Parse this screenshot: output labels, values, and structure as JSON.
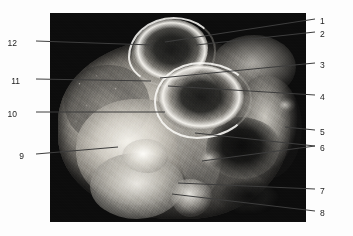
{
  "figure": {
    "kind": "anatomical-photograph",
    "rendering": "grayscale photographic plate on black background",
    "plate": {
      "x": 50,
      "y": 13,
      "width": 256,
      "height": 209,
      "background_color": "#0a0a0a"
    },
    "canvas": {
      "width": 353,
      "height": 236,
      "background_color": "#ffffff"
    }
  },
  "labels": {
    "line_color": "#3d3d3d",
    "text_color": "#1d1d1d",
    "right_side": [
      {
        "id": "1",
        "text": "1",
        "label_x": 320,
        "label_y": 17,
        "line_start_x": 315,
        "line_start_y": 19,
        "line_end_x": 165,
        "line_end_y": 42
      },
      {
        "id": "2",
        "text": "2",
        "label_x": 320,
        "label_y": 30,
        "line_start_x": 315,
        "line_start_y": 32,
        "line_end_x": 196,
        "line_end_y": 45
      },
      {
        "id": "3",
        "text": "3",
        "label_x": 320,
        "label_y": 61,
        "line_start_x": 315,
        "line_start_y": 63,
        "line_end_x": 160,
        "line_end_y": 78
      },
      {
        "id": "4",
        "text": "4",
        "label_x": 320,
        "label_y": 93,
        "line_start_x": 315,
        "line_start_y": 95,
        "line_end_x": 168,
        "line_end_y": 86
      },
      {
        "id": "5",
        "text": "5",
        "label_x": 320,
        "label_y": 128,
        "line_start_x": 315,
        "line_start_y": 130,
        "line_end_x": 285,
        "line_end_y": 127
      },
      {
        "id": "6",
        "text": "6",
        "label_x": 320,
        "label_y": 144,
        "line_start_x": 315,
        "line_start_y": 146,
        "line_end_x": 195,
        "line_end_y": 133
      },
      {
        "id": "6b",
        "text": "",
        "label_x": 0,
        "label_y": 0,
        "line_start_x": 315,
        "line_start_y": 146,
        "line_end_x": 202,
        "line_end_y": 161
      },
      {
        "id": "7",
        "text": "7",
        "label_x": 320,
        "label_y": 187,
        "line_start_x": 315,
        "line_start_y": 189,
        "line_end_x": 178,
        "line_end_y": 183
      },
      {
        "id": "8",
        "text": "8",
        "label_x": 320,
        "label_y": 209,
        "line_start_x": 315,
        "line_start_y": 211,
        "line_end_x": 172,
        "line_end_y": 194
      }
    ],
    "left_side": [
      {
        "id": "12",
        "text": "12",
        "label_x": 17,
        "label_y": 39,
        "line_start_x": 36,
        "line_start_y": 41,
        "line_end_x": 152,
        "line_end_y": 45
      },
      {
        "id": "11",
        "text": "11",
        "label_x": 20,
        "label_y": 77,
        "line_start_x": 36,
        "line_start_y": 79,
        "line_end_x": 151,
        "line_end_y": 81
      },
      {
        "id": "10",
        "text": "10",
        "label_x": 17,
        "label_y": 110,
        "line_start_x": 36,
        "line_start_y": 112,
        "line_end_x": 165,
        "line_end_y": 112
      },
      {
        "id": "9",
        "text": "9",
        "label_x": 24,
        "label_y": 152,
        "line_start_x": 36,
        "line_start_y": 154,
        "line_end_x": 118,
        "line_end_y": 147
      }
    ]
  }
}
